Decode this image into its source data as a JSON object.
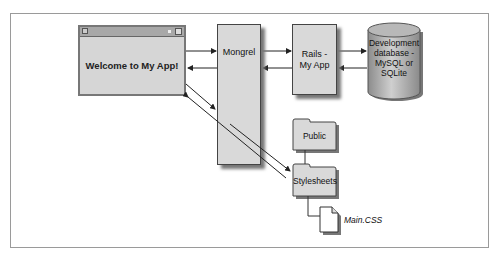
{
  "diagram": {
    "browser_window": {
      "label": "Welcome to My App!"
    },
    "mongrel": {
      "label": "Mongrel"
    },
    "rails": {
      "line1": "Rails -",
      "line2": "My App"
    },
    "database": {
      "line1": "Development",
      "line2": "database -",
      "line3": "MySQL or",
      "line4": "SQLite"
    },
    "folders": [
      {
        "label": "Public"
      },
      {
        "label": "Stylesheets"
      }
    ],
    "file": {
      "label": "Main.CSS"
    },
    "colors": {
      "box_fill": "#d9d9d9",
      "border": "#444444",
      "shadow": "#777777",
      "frame": "#9a9a9a"
    }
  }
}
